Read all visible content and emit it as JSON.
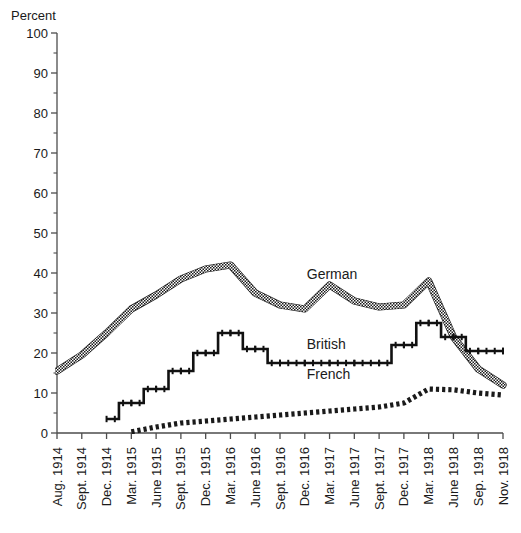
{
  "chart_data": {
    "type": "line",
    "title": "",
    "xlabel": "",
    "ylabel": "Percent",
    "ylim": [
      0,
      100
    ],
    "ytick_step": 10,
    "yminor_step": 5,
    "grid": false,
    "legend_position": "inline-annotations",
    "ytick_labels": [
      "0",
      "10",
      "20",
      "30",
      "40",
      "50",
      "60",
      "70",
      "80",
      "90",
      "100"
    ],
    "categories": [
      "Aug. 1914",
      "Sept. 1914",
      "Dec. 1914",
      "Mar. 1915",
      "June 1915",
      "Sept. 1915",
      "Dec. 1915",
      "Mar. 1916",
      "June 1916",
      "Sept. 1916",
      "Dec. 1916",
      "Mar. 1917",
      "June 1917",
      "Sept. 1917",
      "Dec. 1917",
      "Mar. 1918",
      "June 1918",
      "Sep. 1918",
      "Nov. 1918"
    ],
    "series": [
      {
        "name": "German",
        "style": "thick-hatched-band",
        "x": [
          "Aug. 1914",
          "Sept. 1914",
          "Dec. 1914",
          "Mar. 1915",
          "June 1915",
          "Sept. 1915",
          "Dec. 1915",
          "Mar. 1916",
          "June 1916",
          "Sept. 1916",
          "Dec. 1916",
          "Mar. 1917",
          "June 1917",
          "Sept. 1917",
          "Dec. 1917",
          "Mar. 1918",
          "June 1918",
          "Sep. 1918",
          "Nov. 1918"
        ],
        "values": [
          15.5,
          19.5,
          25.0,
          31.0,
          34.5,
          38.5,
          41.0,
          42.0,
          35.0,
          32.0,
          31.0,
          37.0,
          33.0,
          31.5,
          32.0,
          38.0,
          24.0,
          16.0,
          12.0
        ]
      },
      {
        "name": "British",
        "style": "thick-stepped-dark",
        "x": [
          "Dec. 1914",
          "Mar. 1915",
          "June 1915",
          "Sept. 1915",
          "Dec. 1915",
          "Mar. 1916",
          "June 1916",
          "Sept. 1916",
          "Dec. 1916",
          "Mar. 1917",
          "June 1917",
          "Sept. 1917",
          "Dec. 1917",
          "Mar. 1918",
          "June 1918",
          "Sep. 1918",
          "Nov. 1918"
        ],
        "values": [
          3.5,
          7.5,
          11.0,
          15.5,
          20.0,
          25.0,
          21.0,
          17.5,
          17.5,
          17.5,
          17.5,
          17.5,
          22.0,
          27.5,
          24.0,
          20.5,
          20.5
        ]
      },
      {
        "name": "French",
        "style": "thin-dashed-hatched",
        "x": [
          "Mar. 1915",
          "June 1915",
          "Sept. 1915",
          "Dec. 1915",
          "Mar. 1916",
          "June 1916",
          "Sept. 1916",
          "Dec. 1916",
          "Mar. 1917",
          "June 1917",
          "Sept. 1917",
          "Dec. 1917",
          "Mar. 1918",
          "June 1918",
          "Sep. 1918",
          "Nov. 1918"
        ],
        "values": [
          0.3,
          1.5,
          2.5,
          3.0,
          3.5,
          4.0,
          4.5,
          5.0,
          5.5,
          6.0,
          6.5,
          7.5,
          11.0,
          10.8,
          10.0,
          9.5
        ]
      }
    ],
    "annotations": [
      {
        "text": "German",
        "x_value": "Dec. 1916",
        "y_value": 38.5
      },
      {
        "text": "British",
        "x_value": "Dec. 1916",
        "y_value": 21.0
      },
      {
        "text": "French",
        "x_value": "Dec. 1916",
        "y_value": 13.5
      }
    ],
    "colors": {
      "german": "#7a7a7a",
      "british": "#111111",
      "french": "#222222",
      "axis": "#4d4d4d",
      "text": "#1a1a1a",
      "background": "#ffffff"
    }
  }
}
